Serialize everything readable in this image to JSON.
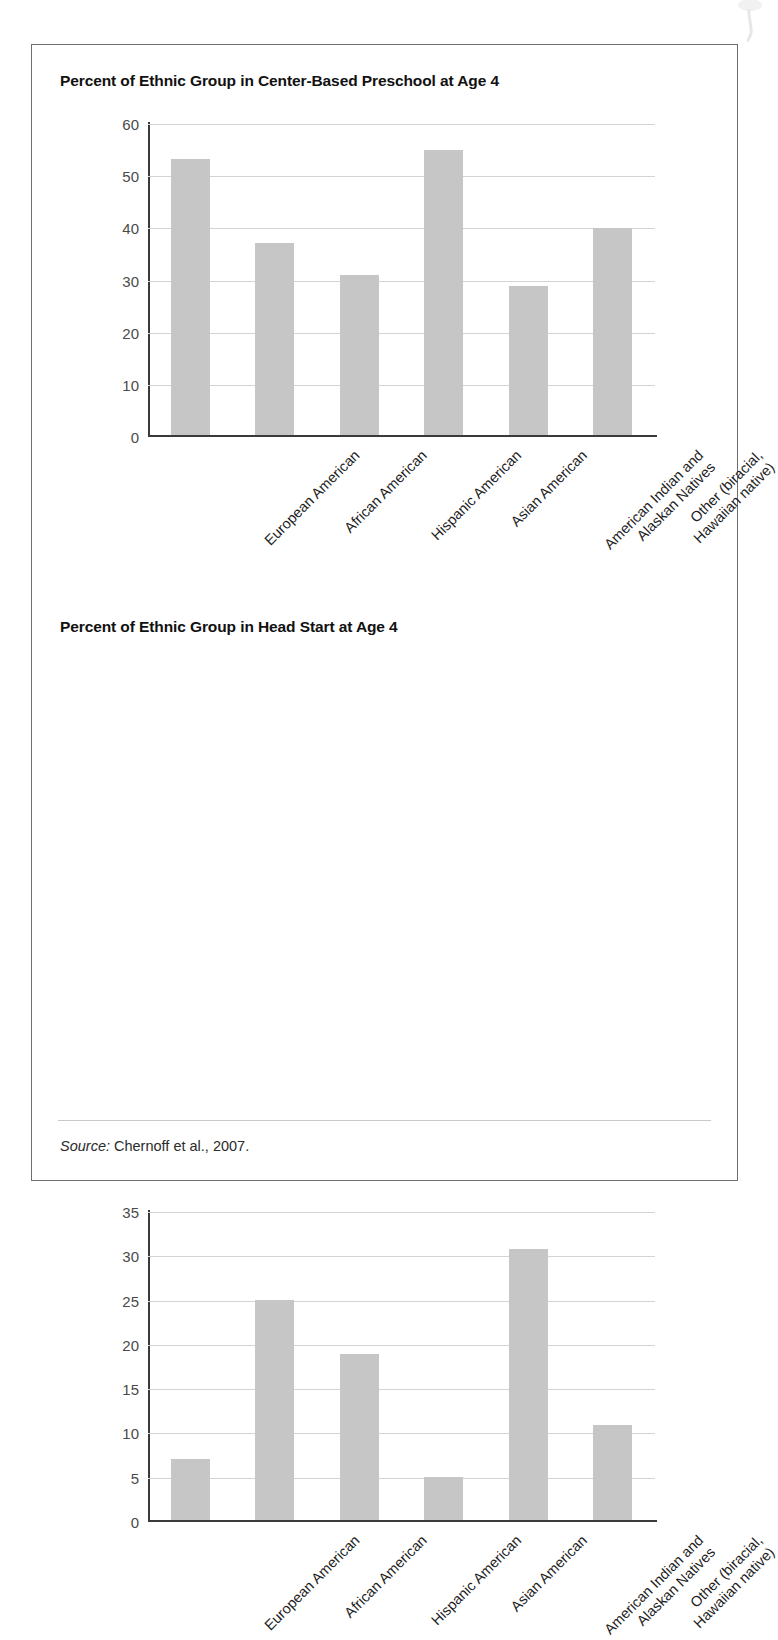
{
  "figure": {
    "source_prefix": "Source:",
    "source_text": " Chernoff et al., 2007.",
    "bar_color": "#c6c6c6",
    "grid_color": "#d3d3d3",
    "axis_color": "#3a3a3a"
  },
  "chart_data": [
    {
      "type": "bar",
      "title": "Percent of Ethnic Group in Center-Based Preschool at Age 4",
      "xlabel": "",
      "ylabel": "",
      "ylim": [
        0,
        60
      ],
      "yticks": [
        0,
        10,
        20,
        30,
        40,
        50,
        60
      ],
      "grid": true,
      "legend": "none",
      "categories": [
        "European American",
        "African American",
        "Hispanic American",
        "Asian American",
        "American Indian and Alaskan Natives",
        "Other (biracial, Hawaiian native)"
      ],
      "category_lines": [
        [
          "European American"
        ],
        [
          "African American"
        ],
        [
          "Hispanic American"
        ],
        [
          "Asian American"
        ],
        [
          "American Indian and",
          "Alaskan Natives"
        ],
        [
          "Other (biracial,",
          "Hawaiian native)"
        ]
      ],
      "values": [
        53.0,
        36.8,
        30.7,
        54.8,
        28.7,
        39.7
      ]
    },
    {
      "type": "bar",
      "title": "Percent of Ethnic Group in Head Start at Age 4",
      "xlabel": "",
      "ylabel": "",
      "ylim": [
        0,
        35
      ],
      "yticks": [
        0,
        5,
        10,
        15,
        20,
        25,
        30,
        35
      ],
      "grid": true,
      "legend": "none",
      "categories": [
        "European American",
        "African American",
        "Hispanic American",
        "Asian American",
        "American Indian and Alaskan Natives",
        "Other (biracial, Hawaiian native)"
      ],
      "category_lines": [
        [
          "European American"
        ],
        [
          "African American"
        ],
        [
          "Hispanic American"
        ],
        [
          "Asian American"
        ],
        [
          "American Indian and",
          "Alaskan Natives"
        ],
        [
          "Other (biracial,",
          "Hawaiian native)"
        ]
      ],
      "values": [
        6.9,
        24.9,
        18.8,
        4.9,
        30.7,
        10.8
      ]
    }
  ]
}
